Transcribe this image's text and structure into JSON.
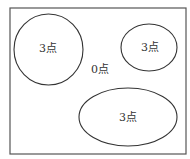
{
  "diagram": {
    "frame": {
      "x": 10,
      "y": 8,
      "width": 176,
      "height": 146,
      "stroke": "#555555"
    },
    "regions": [
      {
        "id": "circle-left",
        "shape": "ellipse",
        "cx": 48.5,
        "cy": 49.5,
        "rx": 34.5,
        "ry": 35.5,
        "label": "3点"
      },
      {
        "id": "circle-right",
        "shape": "ellipse",
        "cx": 149,
        "cy": 47.5,
        "rx": 28,
        "ry": 23.5,
        "label": "3点"
      },
      {
        "id": "ellipse-bottom",
        "shape": "ellipse",
        "cx": 128,
        "cy": 117,
        "rx": 49,
        "ry": 29,
        "label": "3点"
      }
    ],
    "outside_label": "0点",
    "stroke_color": "#333333"
  }
}
